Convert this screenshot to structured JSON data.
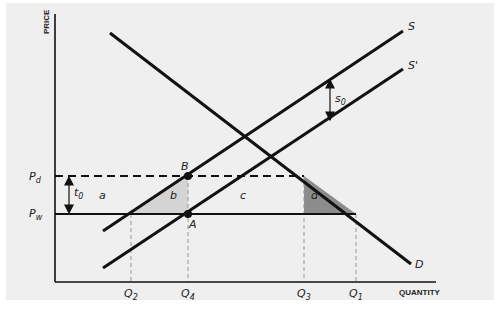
{
  "axes": {
    "y_label": "PRICE",
    "x_label": "QUANTITY"
  },
  "curves": {
    "supply": "S",
    "supply_shifted": "S'",
    "demand": "D"
  },
  "prices": {
    "domestic": "P",
    "domestic_sub": "d",
    "world": "P",
    "world_sub": "w"
  },
  "quantities": [
    {
      "main": "Q",
      "sub": "2"
    },
    {
      "main": "Q",
      "sub": "4"
    },
    {
      "main": "Q",
      "sub": "3"
    },
    {
      "main": "Q",
      "sub": "1"
    }
  ],
  "points": {
    "upper": "B",
    "lower": "A"
  },
  "areas": {
    "a": "a",
    "b": "b",
    "c": "c",
    "d": "d"
  },
  "shifts": {
    "tariff": "t",
    "tariff_sub": "0",
    "subsidy": "s",
    "subsidy_sub": "0"
  },
  "colors": {
    "background": "#efefef",
    "line": "#111111",
    "area_b": "#d4d4d4",
    "area_d": "#8c8c8c",
    "guide": "#999999"
  }
}
